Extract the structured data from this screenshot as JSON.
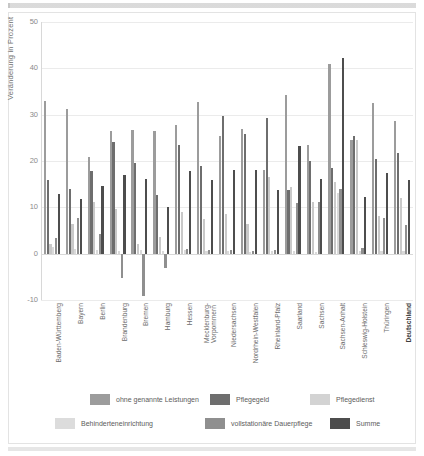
{
  "chart_data": {
    "type": "bar",
    "title": "",
    "xlabel": "",
    "ylabel": "Veränderung in Prozent",
    "ylim": [
      -10,
      50
    ],
    "yticks": [
      50,
      40,
      30,
      20,
      10,
      0,
      -10
    ],
    "grid": true,
    "legend_position": "bottom",
    "categories": [
      "Baden-Württemberg",
      "Bayern",
      "Berlin",
      "Brandenburg",
      "Bremen",
      "Hamburg",
      "Hessen",
      "Mecklenburg-Vorpommern",
      "Niedersachsen",
      "Nordrhein-Westfalen",
      "Rheinland-Pfalz",
      "Saarland",
      "Sachsen",
      "Sachsen-Anhalt",
      "Schleswig-Holstein",
      "Thüringen",
      "Deutschland"
    ],
    "series": [
      {
        "name": "ohne genannte Leistungen",
        "color": "#9c9c9c",
        "values": [
          32.9,
          31.3,
          20.8,
          26.4,
          26.8,
          26.4,
          27.7,
          32.8,
          25.3,
          27.0,
          18.1,
          34.3,
          23.4,
          40.9,
          24.5,
          32.6,
          28.6
        ]
      },
      {
        "name": "Pflegegeld",
        "color": "#6e6e6e",
        "values": [
          15.9,
          13.9,
          17.9,
          24.2,
          19.5,
          12.6,
          23.4,
          19.0,
          29.8,
          25.9,
          29.3,
          13.7,
          20.0,
          18.4,
          25.3,
          20.4,
          21.7
        ]
      },
      {
        "name": "Pflegedienst",
        "color": "#c9c9c9",
        "values": [
          2.1,
          6.5,
          11.1,
          9.7,
          2.0,
          3.5,
          9.0,
          7.4,
          8.6,
          6.3,
          16.6,
          14.5,
          11.2,
          15.5,
          24.5,
          8.2,
          12.0
        ]
      },
      {
        "name": "Behinderteneinrichtung",
        "color": "#d9d9d9",
        "values": [
          1.5,
          1.0,
          0.9,
          0.6,
          0.8,
          0.5,
          0.7,
          0.5,
          0.6,
          0.4,
          0.5,
          0.6,
          0.4,
          13.2,
          0.6,
          0.5,
          0.5
        ]
      },
      {
        "name": "vollstationäre Dauerpflege",
        "color": "#8f8f8f",
        "values": [
          3.3,
          7.7,
          4.2,
          -5.3,
          -9.2,
          -3.1,
          1.1,
          0.8,
          0.9,
          0.6,
          0.8,
          11.0,
          11.1,
          13.9,
          1.2,
          7.7,
          6.1
        ]
      },
      {
        "name": "Summe",
        "color": "#4d4d4d",
        "values": [
          12.8,
          11.8,
          14.6,
          17.0,
          16.1,
          10.0,
          17.8,
          15.9,
          18.0,
          18.1,
          13.7,
          23.3,
          16.1,
          42.2,
          12.2,
          17.4,
          16.0
        ]
      }
    ]
  },
  "legend": {
    "items": [
      {
        "label": "ohne genannte Leistungen",
        "color": "#9c9c9c"
      },
      {
        "label": "Pflegegeld",
        "color": "#6e6e6e"
      },
      {
        "label": "Pflegedienst",
        "color": "#d3d3d3"
      },
      {
        "label": "Behinderteneinrichtung",
        "color": "#dcdcdc"
      },
      {
        "label": "vollstationäre Dauerpflege",
        "color": "#8f8f8f"
      },
      {
        "label": "Summe",
        "color": "#4d4d4d"
      }
    ]
  }
}
